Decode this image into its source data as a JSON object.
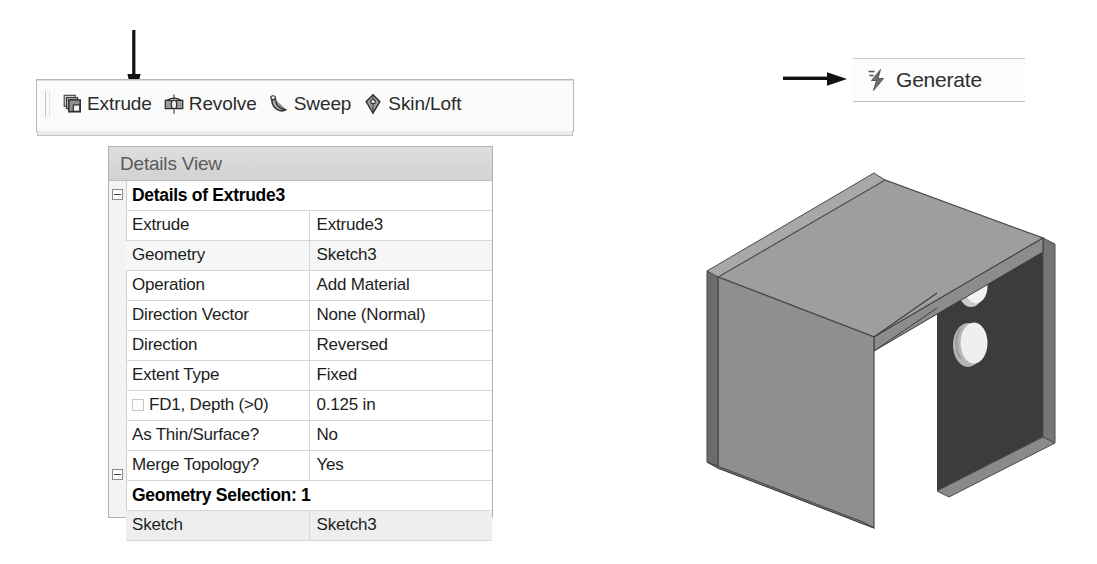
{
  "annotations": {
    "extrude_pointer": "down-arrow",
    "generate_pointer": "right-arrow"
  },
  "toolbar": {
    "name": "Create toolbar",
    "items": [
      {
        "label": "Extrude",
        "icon": "extrude-icon"
      },
      {
        "label": "Revolve",
        "icon": "revolve-icon"
      },
      {
        "label": "Sweep",
        "icon": "sweep-icon"
      },
      {
        "label": "Skin/Loft",
        "icon": "skin-loft-icon"
      }
    ]
  },
  "generate": {
    "label": "Generate",
    "icon": "lightning-bolt-icon"
  },
  "details_view": {
    "title": "Details View",
    "groups": [
      {
        "header": "Details of Extrude3",
        "rows": [
          {
            "key": "Extrude",
            "value": "Extrude3"
          },
          {
            "key": "Geometry",
            "value": "Sketch3"
          },
          {
            "key": "Operation",
            "value": "Add Material"
          },
          {
            "key": "Direction Vector",
            "value": "None (Normal)"
          },
          {
            "key": "Direction",
            "value": "Reversed"
          },
          {
            "key": "Extent Type",
            "value": "Fixed"
          },
          {
            "key": "FD1,  Depth (>0)",
            "value": "0.125 in",
            "checkbox": true
          },
          {
            "key": "As Thin/Surface?",
            "value": "No"
          },
          {
            "key": "Merge Topology?",
            "value": "Yes"
          }
        ]
      },
      {
        "header": "Geometry Selection: 1",
        "rows": [
          {
            "key": "Sketch",
            "value": "Sketch3"
          }
        ]
      }
    ]
  },
  "model": {
    "name": "u-channel-bracket-with-two-holes",
    "description": "Isometric solid model of a U-shaped channel bracket; the right-hand flange carries two circular through-holes.",
    "colors": {
      "top_face": "#9a9a9a",
      "left_face": "#8f8f8f",
      "left_edge": "#6f6f6f",
      "inner_face": "#3c3c3c",
      "hole_fill": "#e8e8e8",
      "outline": "#4a4a4a"
    }
  }
}
